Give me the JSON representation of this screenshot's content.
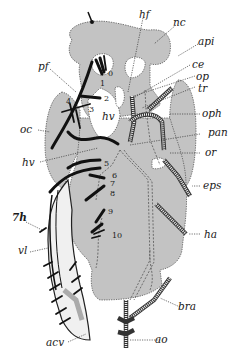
{
  "figure": {
    "type": "anatomical diagram",
    "fill_color": "#c3c3c3",
    "line_color": "#1a1a1a",
    "labels": {
      "hf": "hf",
      "nc": "nc",
      "api": "api",
      "ce": "ce",
      "op": "op",
      "tr": "tr",
      "pf": "pf",
      "oph": "oph",
      "oc": "oc",
      "hv_upper": "hv",
      "pan": "pan",
      "or": "or",
      "hv_lower": "hv",
      "eps": "eps",
      "h7": "7h",
      "vl": "vl",
      "ha": "ha",
      "bra": "bra",
      "acv": "acv",
      "ao": "ao"
    },
    "numbers": [
      "0",
      "1",
      "2",
      "3",
      "4",
      "5",
      "6",
      "7",
      "8",
      "9",
      "10"
    ]
  }
}
